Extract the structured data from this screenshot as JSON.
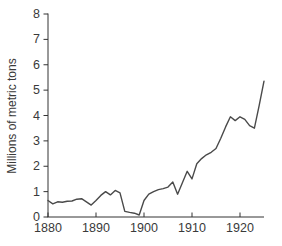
{
  "chart_data": {
    "type": "line",
    "title": "",
    "xlabel": "",
    "ylabel": "Millions of metric tons",
    "xlim": [
      1880,
      1925
    ],
    "ylim": [
      0,
      8
    ],
    "x_ticks": [
      1880,
      1890,
      1900,
      1910,
      1920
    ],
    "y_ticks": [
      0,
      1,
      2,
      3,
      4,
      5,
      6,
      7,
      8
    ],
    "grid": false,
    "legend": "none",
    "line_color": "#4a4a4a",
    "axis_color": "#333333",
    "text_color": "#3a3a3a",
    "series": [
      {
        "name": "metric-tons",
        "x": [
          1880,
          1881,
          1882,
          1883,
          1884,
          1885,
          1886,
          1887,
          1888,
          1889,
          1890,
          1891,
          1892,
          1893,
          1894,
          1895,
          1896,
          1897,
          1898,
          1899,
          1900,
          1901,
          1902,
          1903,
          1904,
          1905,
          1906,
          1907,
          1908,
          1909,
          1910,
          1911,
          1912,
          1913,
          1914,
          1915,
          1916,
          1917,
          1918,
          1919,
          1920,
          1921,
          1922,
          1923,
          1924,
          1925
        ],
        "y": [
          0.65,
          0.52,
          0.6,
          0.58,
          0.62,
          0.63,
          0.7,
          0.72,
          0.6,
          0.47,
          0.65,
          0.85,
          1.0,
          0.87,
          1.05,
          0.95,
          0.22,
          0.18,
          0.15,
          0.08,
          0.65,
          0.9,
          1.0,
          1.08,
          1.12,
          1.18,
          1.38,
          0.9,
          1.35,
          1.8,
          1.5,
          2.1,
          2.3,
          2.45,
          2.55,
          2.7,
          3.1,
          3.55,
          3.95,
          3.8,
          3.95,
          3.85,
          3.6,
          3.5,
          4.4,
          5.35
        ]
      }
    ]
  }
}
